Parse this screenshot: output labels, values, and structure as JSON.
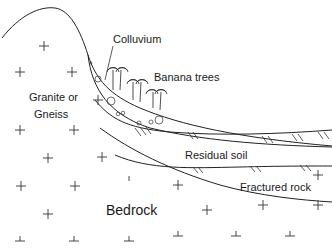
{
  "figure": {
    "type": "geological cross-section",
    "labels": {
      "colluvium": "Colluvium",
      "banana_trees": "Banana trees",
      "granite_line1": "Granite or",
      "granite_line2": "Gneiss",
      "residual_soil": "Residual soil",
      "fractured_rock": "Fractured rock",
      "bedrock": "Bedrock"
    },
    "layers": [
      "Colluvium",
      "Residual soil",
      "Fractured rock",
      "Bedrock"
    ],
    "rock_type": "Granite or Gneiss",
    "vegetation": "Banana trees",
    "colors": {
      "line": "#222222",
      "background": "#ffffff"
    }
  }
}
